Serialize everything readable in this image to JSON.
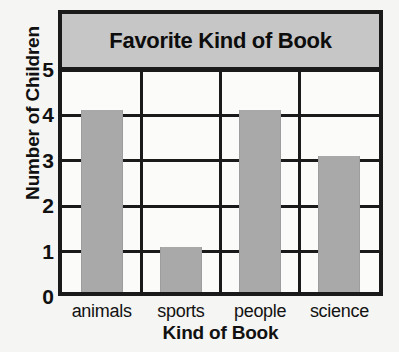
{
  "chart_data": {
    "type": "bar",
    "title": "Favorite Kind of Book",
    "xlabel": "Kind of Book",
    "ylabel": "Number of Children",
    "categories": [
      "animals",
      "sports",
      "people",
      "science"
    ],
    "values": [
      4,
      1,
      4,
      3
    ],
    "ylim": [
      0,
      5
    ],
    "ytick_labels": [
      "0",
      "1",
      "2",
      "3",
      "4",
      "5"
    ],
    "grid": true,
    "legend": "none",
    "bar_color": "#a9a9a9",
    "banner_color": "#c6c6c6",
    "frame_color": "#1a1a1a",
    "background_color": "#f5f5f3"
  }
}
